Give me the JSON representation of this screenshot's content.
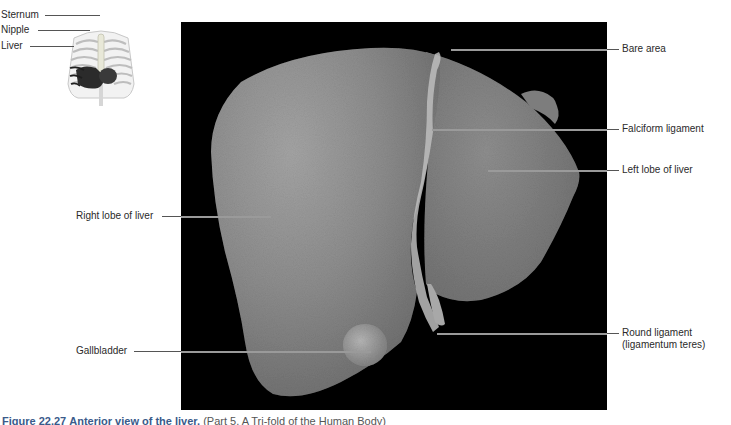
{
  "inset": {
    "labels": [
      {
        "text": "Sternum"
      },
      {
        "text": "Nipple"
      },
      {
        "text": "Liver"
      }
    ]
  },
  "labels_left": [
    {
      "text": "Right lobe of liver"
    },
    {
      "text": "Gallbladder"
    }
  ],
  "labels_right": [
    {
      "text": "Bare area"
    },
    {
      "text": "Falciform ligament"
    },
    {
      "text": "Left lobe of liver"
    },
    {
      "text": "Round ligament"
    },
    {
      "text": "(ligamentum teres)"
    }
  ],
  "caption": {
    "figure": "Figure 22.27",
    "title": "Anterior view of the liver.",
    "source": "(Part 5, A Tri-fold of the Human Body)"
  },
  "colors": {
    "photo_background": "#000000",
    "liver_surface": "#8a8a8a",
    "leader_line": "#555555",
    "caption_accent": "#3a5a8a"
  }
}
